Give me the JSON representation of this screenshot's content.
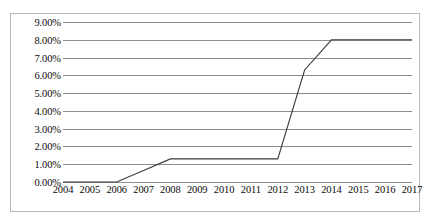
{
  "chart_data": {
    "type": "line",
    "title": "",
    "xlabel": "",
    "ylabel": "",
    "categories": [
      "2004",
      "2005",
      "2006",
      "2007",
      "2008",
      "2009",
      "2010",
      "2011",
      "2012",
      "2013",
      "2014",
      "2015",
      "2016",
      "2017"
    ],
    "values": [
      0.0,
      0.0,
      0.0,
      0.65,
      1.3,
      1.3,
      1.3,
      1.3,
      1.3,
      6.3,
      8.0,
      8.0,
      8.0,
      8.0
    ],
    "series": [
      {
        "name": "",
        "values": [
          0.0,
          0.0,
          0.0,
          0.65,
          1.3,
          1.3,
          1.3,
          1.3,
          1.3,
          6.3,
          8.0,
          8.0,
          8.0,
          8.0
        ]
      }
    ],
    "ylim": [
      0,
      9
    ],
    "ytick_values": [
      0,
      1,
      2,
      3,
      4,
      5,
      6,
      7,
      8,
      9
    ],
    "ytick_labels": [
      "0.00%",
      "1.00%",
      "2.00%",
      "3.00%",
      "4.00%",
      "5.00%",
      "6.00%",
      "7.00%",
      "8.00%",
      "9.00%"
    ],
    "grid": "horizontal",
    "legend": "none",
    "line_color": "#3a3a3a",
    "gridline_color": "#8c8c8c",
    "background_color": "#ffffff",
    "border_color": "#b9b9b9"
  }
}
